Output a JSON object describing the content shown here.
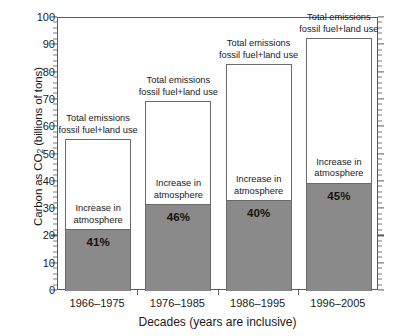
{
  "chart_data": {
    "type": "bar",
    "title": "",
    "xlabel": "Decades (years are inclusive)",
    "ylabel": "Carbon as CO2 (billions of tons)",
    "ylabel_prefix": "Carbon as CO",
    "ylabel_sub": "2",
    "ylabel_suffix": " (billions of tons)",
    "ylim": [
      0,
      100
    ],
    "ytick_step": 10,
    "yminor_step": 2,
    "grid": false,
    "legend": "none",
    "categories": [
      "1966–1975",
      "1976–1985",
      "1986–1995",
      "1996–2005"
    ],
    "yticks": [
      "0",
      "10",
      "20",
      "30",
      "40",
      "50",
      "60",
      "70",
      "80",
      "90",
      "100"
    ],
    "series": [
      {
        "name": "Total emissions fossil fuel+land use",
        "label": "Total emissions\nfossil fuel+land use",
        "label_line1": "Total emissions",
        "label_line2": "fossil fuel+land use",
        "values": [
          55.5,
          69.5,
          83.0,
          92.5
        ],
        "style": "outline-white"
      },
      {
        "name": "Increase in atmosphere",
        "label": "Increase in\natmosphere",
        "label_line1": "Increase in",
        "label_line2": "atmosphere",
        "values": [
          22.7,
          31.8,
          33.2,
          39.6
        ],
        "percent_labels": [
          "41%",
          "46%",
          "40%",
          "45%"
        ],
        "style": "filled-gray"
      }
    ],
    "colors": {
      "fill_gray": "#8a8a8a",
      "outline": "#6a6a6a",
      "axis": "#5a5a5a",
      "text": "#1a1a1a",
      "background": "#ffffff"
    }
  },
  "bars": [
    {
      "category": "1966–1975",
      "total_label_line1": "Total emissions",
      "total_label_line2": "fossil fuel+land use",
      "increase_label_line1": "Increase in",
      "increase_label_line2": "atmosphere",
      "percent": "41%",
      "total_value": 55.5,
      "increase_value": 22.7
    },
    {
      "category": "1976–1985",
      "total_label_line1": "Total emissions",
      "total_label_line2": "fossil fuel+land use",
      "increase_label_line1": "Increase in",
      "increase_label_line2": "atmosphere",
      "percent": "46%",
      "total_value": 69.5,
      "increase_value": 31.8
    },
    {
      "category": "1986–1995",
      "total_label_line1": "Total emissions",
      "total_label_line2": "fossil fuel+land use",
      "increase_label_line1": "Increase in",
      "increase_label_line2": "atmosphere",
      "percent": "40%",
      "total_value": 83.0,
      "increase_value": 33.2
    },
    {
      "category": "1996–2005",
      "total_label_line1": "Total emissions",
      "total_label_line2": "fossil fuel+land use",
      "increase_label_line1": "Increase in",
      "increase_label_line2": "atmosphere",
      "percent": "45%",
      "total_value": 92.5,
      "increase_value": 39.6
    }
  ]
}
